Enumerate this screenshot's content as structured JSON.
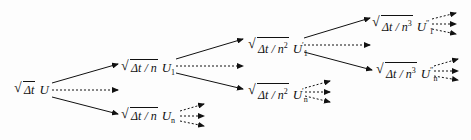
{
  "diagram": {
    "type": "tree",
    "root": {
      "radicand": "Δt",
      "power": "",
      "var": "U",
      "sub": "",
      "prime": ""
    },
    "level1": [
      {
        "radicand": "Δt / n",
        "power": "",
        "var": "U",
        "sub": "1",
        "prime": ""
      },
      {
        "radicand": "Δt / n",
        "power": "",
        "var": "U",
        "sub": "n",
        "prime": ""
      }
    ],
    "level2": [
      {
        "radicand": "Δt / n",
        "power": "2",
        "var": "U",
        "sub": "1",
        "prime": "′"
      },
      {
        "radicand": "Δt / n",
        "power": "2",
        "var": "U",
        "sub": "n",
        "prime": "′"
      }
    ],
    "level3": [
      {
        "radicand": "Δt / n",
        "power": "3",
        "var": "U",
        "sub": "1",
        "prime": "″"
      },
      {
        "radicand": "Δt / n",
        "power": "3",
        "var": "U",
        "sub": "n",
        "prime": "″"
      }
    ],
    "edge_styles": {
      "solid": "explicit child",
      "dashed": "omitted intermediate children"
    },
    "colors": {
      "ink": "#111111",
      "background": "#fdfdfd"
    }
  }
}
